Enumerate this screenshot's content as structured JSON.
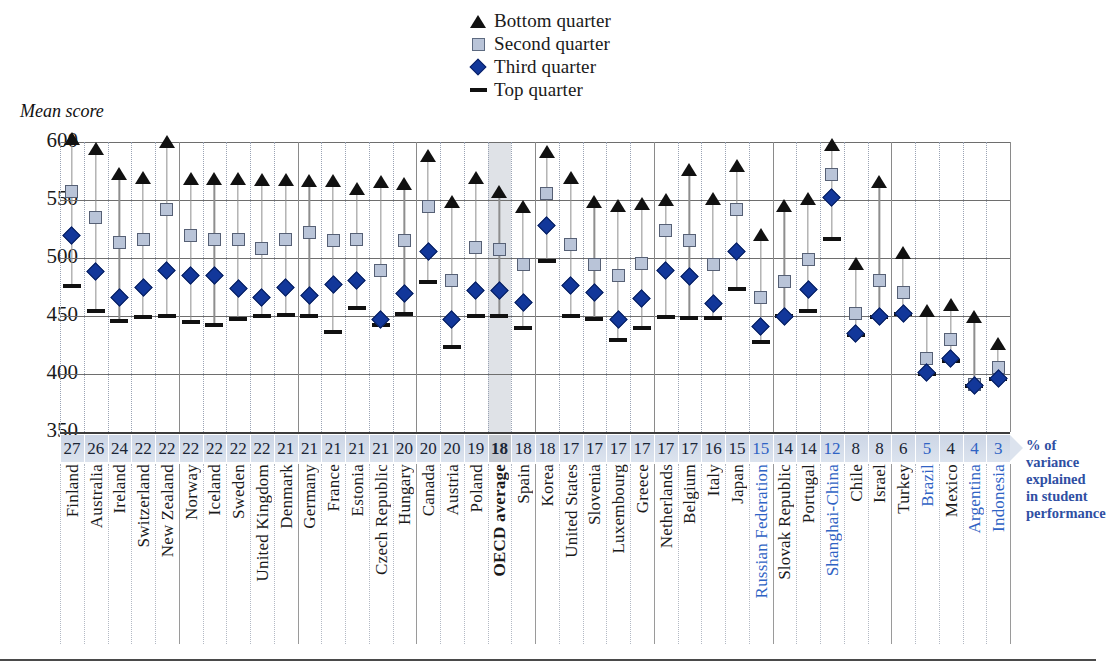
{
  "axis_title": "Mean score",
  "legend": [
    {
      "name": "bottom-quarter",
      "label": "Bottom quarter",
      "marker": "triangle",
      "color": "#111111"
    },
    {
      "name": "second-quarter",
      "label": "Second quarter",
      "marker": "square",
      "color": "#b9c4d8"
    },
    {
      "name": "third-quarter",
      "label": "Third quarter",
      "marker": "diamond",
      "color": "#12379a"
    },
    {
      "name": "top-quarter",
      "label": "Top quarter",
      "marker": "dash",
      "color": "#111111"
    }
  ],
  "note": "% of variance explained in student performance",
  "note_lines": [
    "% of",
    "variance",
    "explained",
    "in student",
    "performance"
  ],
  "chart_data": {
    "type": "scatter",
    "title": "",
    "xlabel": "",
    "ylabel": "Mean score",
    "ylim": [
      350,
      600
    ],
    "yticks": [
      350,
      400,
      450,
      500,
      550,
      600
    ],
    "grid": true,
    "legend_position": "top-center",
    "secondary_axis_label": "% of variance explained in student performance",
    "categories": [
      "Finland",
      "Australia",
      "Ireland",
      "Switzerland",
      "New Zealand",
      "Norway",
      "Iceland",
      "Sweden",
      "United Kingdom",
      "Denmark",
      "Germany",
      "France",
      "Estonia",
      "Czech Republic",
      "Hungary",
      "Canada",
      "Austria",
      "Poland",
      "OECD average",
      "Spain",
      "Korea",
      "United States",
      "Slovenia",
      "Luxembourg",
      "Greece",
      "Netherlands",
      "Belgium",
      "Italy",
      "Japan",
      "Russian Federation",
      "Slovak Republic",
      "Portugal",
      "Shanghai-China",
      "Chile",
      "Israel",
      "Turkey",
      "Brazil",
      "Mexico",
      "Argentina",
      "Indonesia"
    ],
    "highlighted_category": "OECD average",
    "non_oecd_categories": [
      "Russian Federation",
      "Shanghai-China",
      "Brazil",
      "Argentina",
      "Indonesia"
    ],
    "variance_explained_pct": [
      27,
      26,
      24,
      22,
      22,
      22,
      22,
      22,
      22,
      21,
      21,
      21,
      21,
      21,
      20,
      20,
      20,
      19,
      18,
      18,
      18,
      17,
      17,
      17,
      17,
      17,
      17,
      16,
      15,
      15,
      14,
      14,
      12,
      8,
      8,
      6,
      5,
      4,
      4,
      3
    ],
    "series": [
      {
        "name": "Bottom quarter",
        "marker": "triangle",
        "values": [
          597,
          589,
          567,
          564,
          595,
          563,
          563,
          563,
          562,
          562,
          561,
          561,
          554,
          560,
          559,
          583,
          543,
          564,
          552,
          539,
          586,
          564,
          543,
          540,
          541,
          545,
          571,
          546,
          574,
          515,
          540,
          546,
          592,
          490,
          560,
          499,
          449,
          454,
          444,
          421
        ]
      },
      {
        "name": "Second quarter",
        "marker": "square",
        "values": [
          557,
          535,
          513,
          516,
          542,
          519,
          516,
          516,
          508,
          516,
          522,
          515,
          516,
          489,
          515,
          544,
          481,
          509,
          507,
          494,
          556,
          512,
          494,
          485,
          495,
          524,
          515,
          494,
          542,
          466,
          480,
          499,
          572,
          452,
          481,
          470,
          413,
          430,
          391,
          406
        ]
      },
      {
        "name": "Third quarter",
        "marker": "diamond",
        "values": [
          519,
          488,
          466,
          475,
          489,
          485,
          485,
          474,
          466,
          475,
          468,
          477,
          481,
          447,
          469,
          506,
          447,
          472,
          472,
          462,
          528,
          476,
          470,
          447,
          465,
          489,
          484,
          461,
          506,
          441,
          450,
          473,
          552,
          435,
          450,
          452,
          401,
          413,
          390,
          396
        ]
      },
      {
        "name": "Top quarter",
        "marker": "dash",
        "values": [
          476,
          454,
          446,
          449,
          450,
          445,
          442,
          447,
          450,
          451,
          450,
          436,
          457,
          442,
          452,
          479,
          423,
          450,
          450,
          440,
          497,
          450,
          447,
          429,
          440,
          449,
          448,
          448,
          473,
          428,
          450,
          454,
          516,
          434,
          449,
          452,
          400,
          411,
          390,
          396
        ]
      }
    ]
  }
}
